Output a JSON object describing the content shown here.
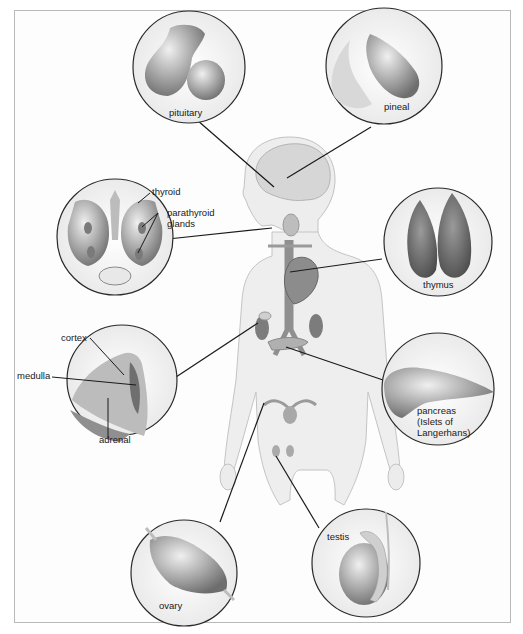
{
  "figure": {
    "colors": {
      "frame": "#b9b9b9",
      "body_fill": "#ececec",
      "body_stroke": "#c4c4c4",
      "organ": "#8a8a8a",
      "leader": "#1a1a1a"
    }
  },
  "glands": [
    {
      "id": "pituitary",
      "label": "pituitary"
    },
    {
      "id": "pineal",
      "label": "pineal"
    },
    {
      "id": "thyroid",
      "label": "thyroid",
      "sublabel": "parathyroid glands",
      "sublabel_lines": [
        "parathyroid",
        "glands"
      ]
    },
    {
      "id": "thymus",
      "label": "thymus"
    },
    {
      "id": "adrenal",
      "label": "adrenal",
      "parts": [
        "cortex",
        "medulla"
      ]
    },
    {
      "id": "pancreas",
      "label": "pancreas",
      "sublabel_lines": [
        "(Islets of",
        "Langerhans)"
      ]
    },
    {
      "id": "ovary",
      "label": "ovary"
    },
    {
      "id": "testis",
      "label": "testis"
    }
  ],
  "labels": {
    "pituitary": "pituitary",
    "pineal": "pineal",
    "thyroid": "thyroid",
    "parathyroid_1": "parathyroid",
    "parathyroid_2": "glands",
    "thymus": "thymus",
    "cortex": "cortex",
    "medulla": "medulla",
    "adrenal": "adrenal",
    "pancreas_1": "pancreas",
    "pancreas_2": "(Islets of",
    "pancreas_3": "Langerhans)",
    "ovary": "ovary",
    "testis": "testis"
  }
}
